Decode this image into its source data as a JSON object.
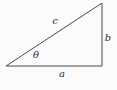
{
  "figure": {
    "type": "right-triangle",
    "background_color": "#fbfbfb",
    "line_color": "#4a4a4a",
    "label_color": "#2b2b2b",
    "triangle": {
      "points": "6,66 102,3 102,66"
    },
    "labels": {
      "hypotenuse": "c",
      "vertical_side": "b",
      "horizontal_side": "a",
      "angle": "θ"
    }
  }
}
